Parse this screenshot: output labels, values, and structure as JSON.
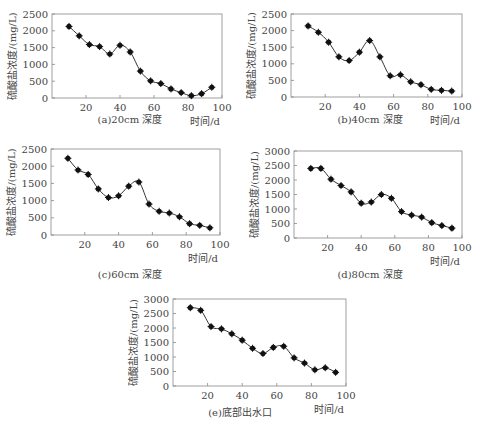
{
  "chart_data": [
    {
      "id": "a",
      "type": "line",
      "title": "(a)20cm 深度",
      "xlabel": "时间/d",
      "ylabel": "硫酸盐浓度/(mg/L)",
      "xlim": [
        0,
        100
      ],
      "ylim": [
        0,
        2500
      ],
      "xticks": [
        20,
        40,
        60,
        80,
        100
      ],
      "yticks": [
        0,
        500,
        1000,
        1500,
        2000,
        2500
      ],
      "x": [
        10,
        16,
        22,
        28,
        34,
        40,
        46,
        52,
        58,
        64,
        70,
        76,
        82,
        88,
        94
      ],
      "values": [
        2130,
        1850,
        1590,
        1530,
        1310,
        1570,
        1370,
        800,
        510,
        430,
        270,
        160,
        70,
        130,
        320
      ],
      "grid": false,
      "marker": "filled-diamond"
    },
    {
      "id": "b",
      "type": "line",
      "title": "(b)40cm 深度",
      "xlabel": "时间/d",
      "ylabel": "硫酸盐浓度/(mg/L)",
      "xlim": [
        0,
        100
      ],
      "ylim": [
        0,
        2500
      ],
      "xticks": [
        20,
        40,
        60,
        80,
        100
      ],
      "yticks": [
        0,
        500,
        1000,
        1500,
        2000,
        2500
      ],
      "x": [
        10,
        16,
        22,
        28,
        34,
        40,
        46,
        52,
        58,
        64,
        70,
        76,
        82,
        88,
        94
      ],
      "values": [
        2140,
        1950,
        1650,
        1210,
        1100,
        1350,
        1700,
        1210,
        640,
        670,
        460,
        370,
        230,
        200,
        180
      ],
      "grid": false,
      "marker": "filled-diamond"
    },
    {
      "id": "c",
      "type": "line",
      "title": "(c)60cm 深度",
      "xlabel": "时间/d",
      "ylabel": "硫酸盐浓度/(mg/L)",
      "xlim": [
        0,
        100
      ],
      "ylim": [
        0,
        2500
      ],
      "xticks": [
        20,
        40,
        60,
        80,
        100
      ],
      "yticks": [
        0,
        500,
        1000,
        1500,
        2000,
        2500
      ],
      "x": [
        10,
        16,
        22,
        28,
        34,
        40,
        46,
        52,
        58,
        64,
        70,
        76,
        82,
        88,
        94
      ],
      "values": [
        2230,
        1890,
        1760,
        1340,
        1090,
        1140,
        1420,
        1540,
        900,
        690,
        640,
        530,
        330,
        280,
        210
      ],
      "grid": false,
      "marker": "filled-diamond"
    },
    {
      "id": "d",
      "type": "line",
      "title": "(d)80cm 深度",
      "xlabel": "时间/d",
      "ylabel": "硫酸盐浓度/(mg/L)",
      "xlim": [
        0,
        100
      ],
      "ylim": [
        0,
        3000
      ],
      "xticks": [
        20,
        40,
        60,
        80,
        100
      ],
      "yticks": [
        0,
        500,
        1000,
        1500,
        2000,
        2500,
        3000
      ],
      "x": [
        10,
        16,
        22,
        28,
        34,
        40,
        46,
        52,
        58,
        64,
        70,
        76,
        82,
        88,
        94
      ],
      "values": [
        2400,
        2400,
        2030,
        1810,
        1590,
        1200,
        1240,
        1500,
        1370,
        910,
        790,
        720,
        530,
        430,
        340
      ],
      "grid": false,
      "marker": "filled-diamond"
    },
    {
      "id": "e",
      "type": "line",
      "title": "(e)底部出水口",
      "xlabel": "时间/d",
      "ylabel": "硫酸盐浓度/(mg/L)",
      "xlim": [
        0,
        100
      ],
      "ylim": [
        0,
        3000
      ],
      "xticks": [
        20,
        40,
        60,
        80,
        100
      ],
      "yticks": [
        0,
        500,
        1000,
        1500,
        2000,
        2500,
        3000
      ],
      "x": [
        10,
        16,
        22,
        28,
        34,
        40,
        46,
        52,
        58,
        64,
        70,
        76,
        82,
        88,
        94
      ],
      "values": [
        2700,
        2610,
        2050,
        1970,
        1800,
        1580,
        1300,
        1120,
        1330,
        1370,
        970,
        790,
        560,
        630,
        470
      ],
      "grid": false,
      "marker": "filled-diamond"
    }
  ],
  "layout": {
    "panels": [
      {
        "id": "a",
        "plot": {
          "x": 52,
          "y": 14,
          "w": 170,
          "h": 84
        },
        "caption_x": 70,
        "caption_y": 111,
        "caption_w": 120
      },
      {
        "id": "b",
        "plot": {
          "x": 291,
          "y": 14,
          "w": 171,
          "h": 83
        },
        "caption_x": 310,
        "caption_y": 111,
        "caption_w": 120
      },
      {
        "id": "c",
        "plot": {
          "x": 51,
          "y": 149,
          "w": 169,
          "h": 86
        },
        "caption_x": 70,
        "caption_y": 266,
        "caption_w": 120
      },
      {
        "id": "d",
        "plot": {
          "x": 294,
          "y": 151,
          "w": 168,
          "h": 87
        },
        "caption_x": 310,
        "caption_y": 266,
        "caption_w": 120
      },
      {
        "id": "e",
        "plot": {
          "x": 173,
          "y": 299,
          "w": 173,
          "h": 87
        },
        "caption_x": 180,
        "caption_y": 404,
        "caption_w": 120
      }
    ]
  },
  "colors": {
    "axis": "#888888",
    "line": "#333333",
    "marker": "#111111",
    "text": "#444444"
  }
}
